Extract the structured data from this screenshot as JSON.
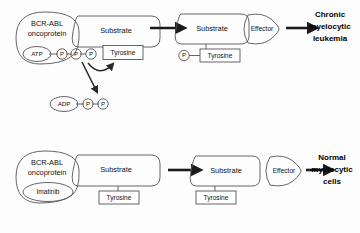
{
  "figure": {
    "background_color": "#fdfdfd"
  },
  "colors": {
    "shape_light": "#e8e8e8",
    "shape_mid": "#d8d8d8",
    "shape_dark": "#c2c2c2",
    "outline": "#555555",
    "arrow": "#1b1b1b",
    "text": "#111111"
  },
  "rows": [
    {
      "id": "row-untreated",
      "oncoprotein": {
        "line1": "BCR-ABL",
        "line2": "oncoprotein"
      },
      "nucleotide": {
        "label": "ATP",
        "phosphates": [
          "P",
          "P",
          "P"
        ]
      },
      "byproduct": {
        "label": "ADP",
        "phosphates": [
          "P",
          "P"
        ]
      },
      "substrate_left_label": "Substrate",
      "tyrosine_left_label": "Tyrosine",
      "substrate_right_label": "Substrate",
      "effector_label": "Effector",
      "phospho_marker": "P",
      "tyrosine_right_label": "Tyrosine",
      "outcome": [
        "Chronic",
        "myelocytic",
        "leukemia"
      ]
    },
    {
      "id": "row-imatinib",
      "oncoprotein": {
        "line1": "BCR-ABL",
        "line2": "oncoprotein"
      },
      "drug_label": "Imatinib",
      "substrate_left_label": "Substrate",
      "tyrosine_left_label": "Tyrosine",
      "substrate_right_label": "Substrate",
      "effector_label": "Effector",
      "tyrosine_right_label": "Tyrosine",
      "outcome": [
        "Normal",
        "myelocytic",
        "cells"
      ]
    }
  ]
}
